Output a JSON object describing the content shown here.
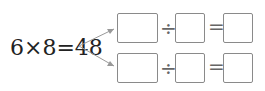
{
  "equation": "6×8=48",
  "rows": [
    {
      "dividend": "",
      "divide_sign": "÷",
      "divisor": "",
      "equals_sign": "=",
      "quotient": ""
    },
    {
      "dividend": "",
      "divide_sign": "÷",
      "divisor": "",
      "equals_sign": "=",
      "quotient": ""
    }
  ],
  "colors": {
    "box_border": "#8a8a8a",
    "arrow": "#999999",
    "text": "#222222"
  }
}
